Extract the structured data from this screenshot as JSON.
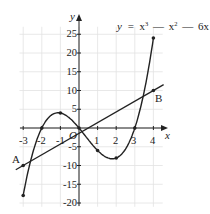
{
  "figure": {
    "equation": {
      "lhs": "y",
      "eq": "=",
      "t1": "x",
      "e1": "3",
      "op1": "—",
      "t2": "x",
      "e2": "2",
      "op2": "—",
      "t3": "6x"
    },
    "axes": {
      "x_label": "x",
      "y_label": "y",
      "origin_label": "O",
      "x_ticks": [
        "-3",
        "-2",
        "-1",
        "1",
        "2",
        "3",
        "4"
      ],
      "y_ticks": [
        "25",
        "20",
        "15",
        "10",
        "5",
        "-5",
        "-10",
        "-15",
        "-20"
      ]
    },
    "points": {
      "A": "A",
      "B": "B"
    }
  },
  "chart_data": {
    "type": "line",
    "xlabel": "x",
    "ylabel": "y",
    "xlim": [
      -3.3,
      4.5
    ],
    "ylim": [
      -20,
      27
    ],
    "grid": true,
    "series": [
      {
        "name": "y = x^3 - x^2 - 6x",
        "points": [
          [
            -3,
            -18
          ],
          [
            -2,
            0
          ],
          [
            -1,
            4
          ],
          [
            0,
            0
          ],
          [
            1,
            -6
          ],
          [
            2,
            -8
          ],
          [
            3,
            0
          ],
          [
            4,
            24
          ]
        ]
      },
      {
        "name": "line AB",
        "points": [
          [
            -3,
            -10
          ],
          [
            4,
            10
          ]
        ]
      }
    ],
    "annotations": [
      {
        "label": "A",
        "x": -3,
        "y": -10
      },
      {
        "label": "B",
        "x": 4,
        "y": 10
      }
    ]
  }
}
